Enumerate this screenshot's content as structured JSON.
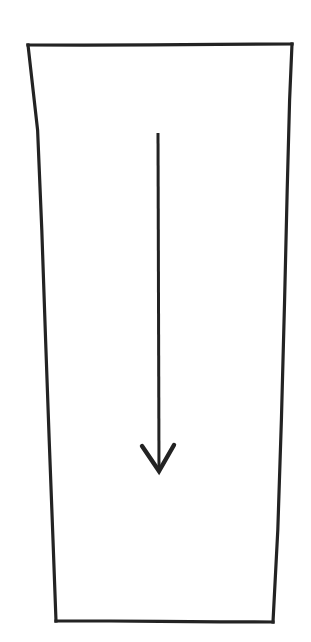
{
  "figure": {
    "title": "",
    "caption": "",
    "background_color": "#ffffff",
    "stroke_color": "#232323",
    "canvas": {
      "width": 311,
      "height": 642
    }
  },
  "shapes": {
    "vessel": {
      "name": "tapered-container-outline",
      "description": "Open-topped tapered quadrilateral, wider at the top than the bottom",
      "stroke_color": "#232323",
      "stroke_width": 3,
      "closed": true,
      "points": [
        {
          "x": 28,
          "y": 45
        },
        {
          "x": 292,
          "y": 44
        },
        {
          "x": 273,
          "y": 622
        },
        {
          "x": 56,
          "y": 621
        }
      ],
      "edges": [
        {
          "name": "top-edge",
          "from": 0,
          "to": 1
        },
        {
          "name": "right-edge",
          "from": 1,
          "to": 2
        },
        {
          "name": "bottom-edge",
          "from": 2,
          "to": 3
        },
        {
          "name": "left-edge",
          "from": 3,
          "to": 0
        }
      ]
    },
    "arrow": {
      "name": "downward-flow-arrow",
      "description": "Vertical arrow pointing downward along the interior axis of the container",
      "direction": "down",
      "stroke_color": "#232323",
      "shaft_width": 3,
      "head_width": 4,
      "shaft": {
        "x1": 158,
        "y1": 133,
        "x2": 159,
        "y2": 470
      },
      "head": {
        "tip": {
          "x": 159,
          "y": 471
        },
        "left_wing": {
          "x": 142,
          "y": 446
        },
        "right_wing": {
          "x": 174,
          "y": 445
        }
      },
      "length_px": 338
    }
  },
  "annotations": {
    "labels": [],
    "dimensions": []
  },
  "chart_data": {
    "type": "diagram",
    "title": "",
    "elements": [
      {
        "id": "vessel",
        "kind": "polygon",
        "label": "tapered container",
        "vertices": [
          [
            28,
            45
          ],
          [
            292,
            44
          ],
          [
            273,
            622
          ],
          [
            56,
            621
          ]
        ],
        "top_width_px": 264,
        "bottom_width_px": 217,
        "height_px": 577
      },
      {
        "id": "arrow",
        "kind": "arrow",
        "label": "downward arrow",
        "from": [
          158,
          133
        ],
        "to": [
          159,
          471
        ],
        "direction": "down"
      }
    ],
    "xlabel": "",
    "ylabel": "",
    "legend": []
  }
}
